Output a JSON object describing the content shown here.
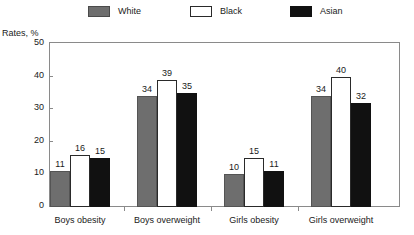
{
  "chart_data": {
    "type": "bar",
    "title": "",
    "subtitle": "",
    "xlabel": "",
    "ylabel": "Rates, %",
    "ylim": [
      0,
      50
    ],
    "yticks": [
      0,
      10,
      20,
      30,
      40,
      50
    ],
    "grid": false,
    "legend_position": "top",
    "categories": [
      "Boys obesity",
      "Boys overweight",
      "Girls obesity",
      "Girls overweight"
    ],
    "series": [
      {
        "name": "White",
        "color": "#6e6e6e",
        "values": [
          11,
          34,
          10,
          34
        ]
      },
      {
        "name": "Black",
        "color": "#ffffff",
        "values": [
          16,
          39,
          15,
          40
        ]
      },
      {
        "name": "Asian",
        "color": "#111111",
        "values": [
          15,
          35,
          11,
          32
        ]
      }
    ]
  },
  "axis": {
    "y_title": "Rates, %",
    "y_tick_labels": [
      "50",
      "40",
      "30",
      "20",
      "10",
      "0"
    ],
    "x_tick_labels": [
      "Boys obesity",
      "Boys overweight",
      "Girls obesity",
      "Girls overweight"
    ]
  },
  "legend": {
    "items": [
      {
        "label": "White",
        "swatch": "gray-swatch-icon"
      },
      {
        "label": "Black",
        "swatch": "white-swatch-icon"
      },
      {
        "label": "Asian",
        "swatch": "black-swatch-icon"
      }
    ]
  },
  "values": {
    "g0": [
      "11",
      "16",
      "15"
    ],
    "g1": [
      "34",
      "39",
      "35"
    ],
    "g2": [
      "10",
      "15",
      "11"
    ],
    "g3": [
      "34",
      "40",
      "32"
    ]
  },
  "colors": {
    "white_series": "#6e6e6e",
    "black_series": "#ffffff",
    "asian_series": "#111111",
    "frame": "#8a8a8a",
    "text": "#1a1a1a"
  }
}
